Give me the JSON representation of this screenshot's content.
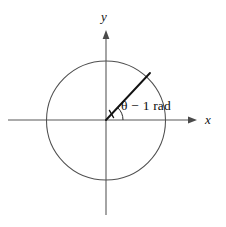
{
  "figure": {
    "kind": "unit-circle-angle-diagram",
    "background_color": "#ffffff",
    "width": 226,
    "height": 227
  },
  "axes": {
    "x_label": "x",
    "y_label": "y",
    "origin": {
      "x": 106,
      "y": 120
    },
    "x_axis": {
      "start_x": 8,
      "end_x": 197,
      "y": 120,
      "arrow": "right"
    },
    "y_axis": {
      "start_y": 30,
      "end_y": 215,
      "x": 106,
      "arrow": "up"
    },
    "line_color": "#595959"
  },
  "circle": {
    "center_x": 106,
    "center_y": 120,
    "radius": 59.5,
    "stroke_color": "#4f4f4f"
  },
  "ray": {
    "from_x": 106,
    "from_y": 120,
    "to_x": 150,
    "to_y": 73,
    "angle_degrees": 47,
    "stroke_color": "#121212"
  },
  "angle": {
    "label": "θ − 1 rad",
    "symbol": "θ",
    "value": "1",
    "unit": "rad",
    "arc_radius": 17,
    "arc_color": "#2a2a2a"
  }
}
